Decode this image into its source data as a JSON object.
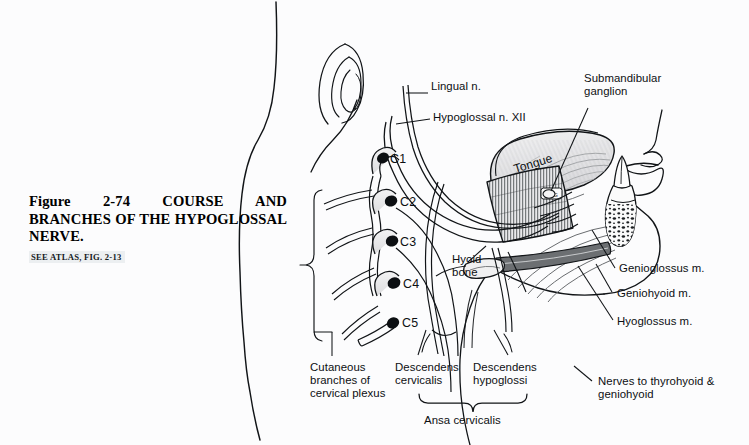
{
  "figure": {
    "caption_title": "Figure 2-74   COURSE AND BRANCHES OF THE HYPOGLOSSAL NERVE.",
    "caption_reference": "SEE ATLAS, FIG. 2-13",
    "caption_reference_lead": "S",
    "background_color": "#fcfcfd",
    "ink_color": "#0c0f12"
  },
  "labels": {
    "lingual_nerve": "Lingual n.",
    "hypoglossal_nerve": "Hypoglossal n. XII",
    "submandibular_ganglion_line1": "Submandibular",
    "submandibular_ganglion_line2": "ganglion",
    "tongue": "Tongue",
    "hyoid_bone_line1": "Hyoid",
    "hyoid_bone_line2": "bone",
    "genioglossus": "Genioglossus m.",
    "geniohyoid": "Geniohyoid m.",
    "hyoglossus": "Hyoglossus m.",
    "nerves_thyrohyoid_line1": "Nerves to thyrohyoid &",
    "nerves_thyrohyoid_line2": "geniohyoid",
    "cutaneous_line1": "Cutaneous",
    "cutaneous_line2": "branches of",
    "cutaneous_line3": "cervical plexus",
    "descendens_cervicalis_line1": "Descendens",
    "descendens_cervicalis_line2": "cervicalis",
    "descendens_hypoglossi_line1": "Descendens",
    "descendens_hypoglossi_line2": "hypoglossi",
    "ansa_cervicalis": "Ansa cervicalis"
  },
  "spinal_roots": {
    "c1": "C1",
    "c2": "C2",
    "c3": "C3",
    "c4": "C4",
    "c5": "C5"
  }
}
